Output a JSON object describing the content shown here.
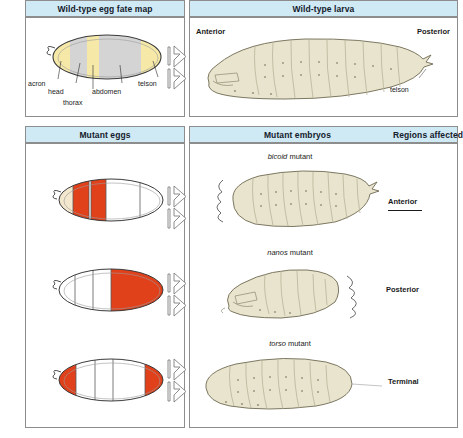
{
  "figure": {
    "colors": {
      "header_blue": "#cfe9f5",
      "border_gray": "#8d8d8d",
      "fate_yellow": "#f6e9a8",
      "fate_gray": "#d4d4d4",
      "mutant_red": "#e0401a",
      "larva_cream": "#e8e4cd",
      "egg_cream": "#f3e7ce"
    }
  },
  "panels": {
    "wildtype_egg": {
      "header": "Wild-type egg fate map",
      "labels": [
        {
          "text": "acron"
        },
        {
          "text": "head"
        },
        {
          "text": "thorax"
        },
        {
          "text": "abdomen"
        },
        {
          "text": "telson"
        }
      ]
    },
    "wildtype_larva": {
      "header": "Wild-type larva",
      "anterior": "Anterior",
      "posterior": "Posterior",
      "telson": "telson"
    },
    "mutant_eggs": {
      "header": "Mutant eggs"
    },
    "mutant_embryos": {
      "header": "Mutant embryos"
    },
    "regions_affected": {
      "header": "Regions affected"
    }
  },
  "mutant_rows": [
    {
      "gene": "bicoid",
      "suffix": " mutant",
      "region": "Anterior",
      "egg_red_zone": "anterior",
      "underline": true
    },
    {
      "gene": "nanos",
      "suffix": " mutant",
      "region": "Posterior",
      "egg_red_zone": "posterior",
      "underline": false
    },
    {
      "gene": "torso",
      "suffix": " mutant",
      "region": "Terminal",
      "egg_red_zone": "both-poles",
      "underline": false
    }
  ]
}
